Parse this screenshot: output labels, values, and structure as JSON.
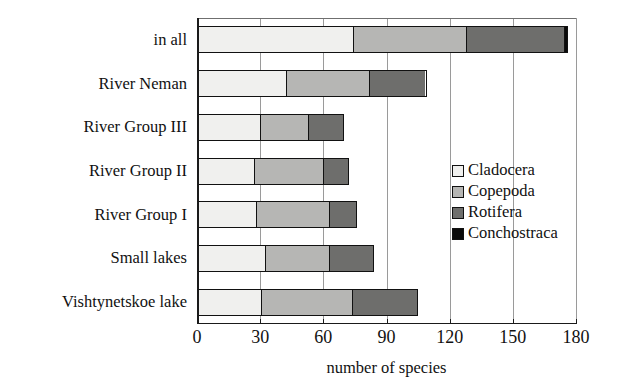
{
  "chart_data": {
    "type": "bar",
    "orientation": "horizontal",
    "stacked": true,
    "title": "",
    "xlabel": "number of species",
    "ylabel": "",
    "xlim": [
      0,
      180
    ],
    "xticks": [
      0,
      30,
      60,
      90,
      120,
      150,
      180
    ],
    "grid": true,
    "legend_position": "inside-right",
    "categories": [
      "in all",
      "River Neman",
      "River Group III",
      "River Group II",
      "River Group I",
      "Small lakes",
      "Vishtynetskoe lake"
    ],
    "series": [
      {
        "name": "Cladocera",
        "color": "#f0f0ee",
        "values": [
          74,
          42,
          30,
          27,
          28,
          32,
          30
        ]
      },
      {
        "name": "Copepoda",
        "color": "#b6b6b4",
        "values": [
          54,
          40,
          23,
          33,
          35,
          31,
          44
        ]
      },
      {
        "name": "Rotifera",
        "color": "#6e6e6c",
        "values": [
          47,
          27,
          17,
          12,
          13,
          21,
          31
        ]
      },
      {
        "name": "Conchostraca",
        "color": "#0a0a0a",
        "values": [
          1,
          0,
          0,
          0,
          0,
          0,
          0
        ]
      }
    ],
    "totals": [
      176,
      109,
      70,
      72,
      76,
      84,
      105
    ]
  },
  "legend": {
    "items": [
      {
        "label": "Cladocera",
        "color": "#f0f0ee"
      },
      {
        "label": "Copepoda",
        "color": "#b6b6b4"
      },
      {
        "label": "Rotifera",
        "color": "#6e6e6c"
      },
      {
        "label": "Conchostraca",
        "color": "#0a0a0a"
      }
    ]
  }
}
